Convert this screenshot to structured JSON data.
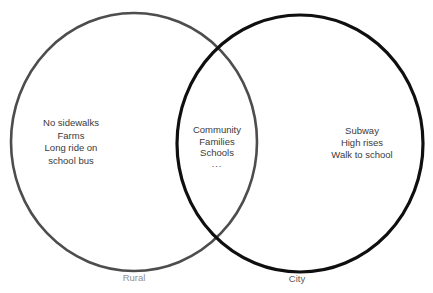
{
  "venn": {
    "type": "venn-diagram",
    "left": {
      "label": "Rural",
      "items": [
        "No sidewalks",
        "Farms",
        "Long ride on school bus"
      ],
      "lines": [
        "No sidewalks",
        "Farms",
        "Long ride on",
        "school bus"
      ],
      "stroke": "#4d4d4d"
    },
    "right": {
      "label": "City",
      "items": [
        "Subway",
        "High rises",
        "Walk to school"
      ],
      "lines": [
        "Subway",
        "High rises",
        "Walk to school"
      ],
      "stroke": "#0f0f0f"
    },
    "intersection": {
      "items": [
        "Community",
        "Families",
        "Schools",
        "..."
      ],
      "lines": [
        "Community",
        "Families",
        "Schools",
        "..."
      ]
    },
    "colors": {
      "background": "#ffffff",
      "item_text": "#3a3a3a",
      "rural_label": "#8f8f8f",
      "city_label": "#5a5a5a"
    }
  }
}
